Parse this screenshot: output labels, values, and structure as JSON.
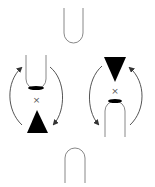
{
  "diagram": {
    "type": "schematic",
    "colors": {
      "background": "#ffffff",
      "outline": "#777777",
      "fill": "#000000",
      "arrow": "#555555"
    },
    "elements": {
      "top_u": {
        "shape": "u-probe-open-down",
        "label": ""
      },
      "bottom_arch": {
        "shape": "u-probe-open-up",
        "label": ""
      },
      "left_group": {
        "probe": "u-probe with blackened bottom",
        "center_mark": "×",
        "tip": "triangle pointing up",
        "arrows": [
          "counter-clockwise left arc (upward)",
          "clockwise right arc (downward)"
        ]
      },
      "right_group": {
        "probe": "arch with blackened top",
        "center_mark": "×",
        "tip": "triangle pointing down",
        "arrows": [
          "left arc (downward)",
          "right arc (upward)"
        ]
      }
    }
  }
}
